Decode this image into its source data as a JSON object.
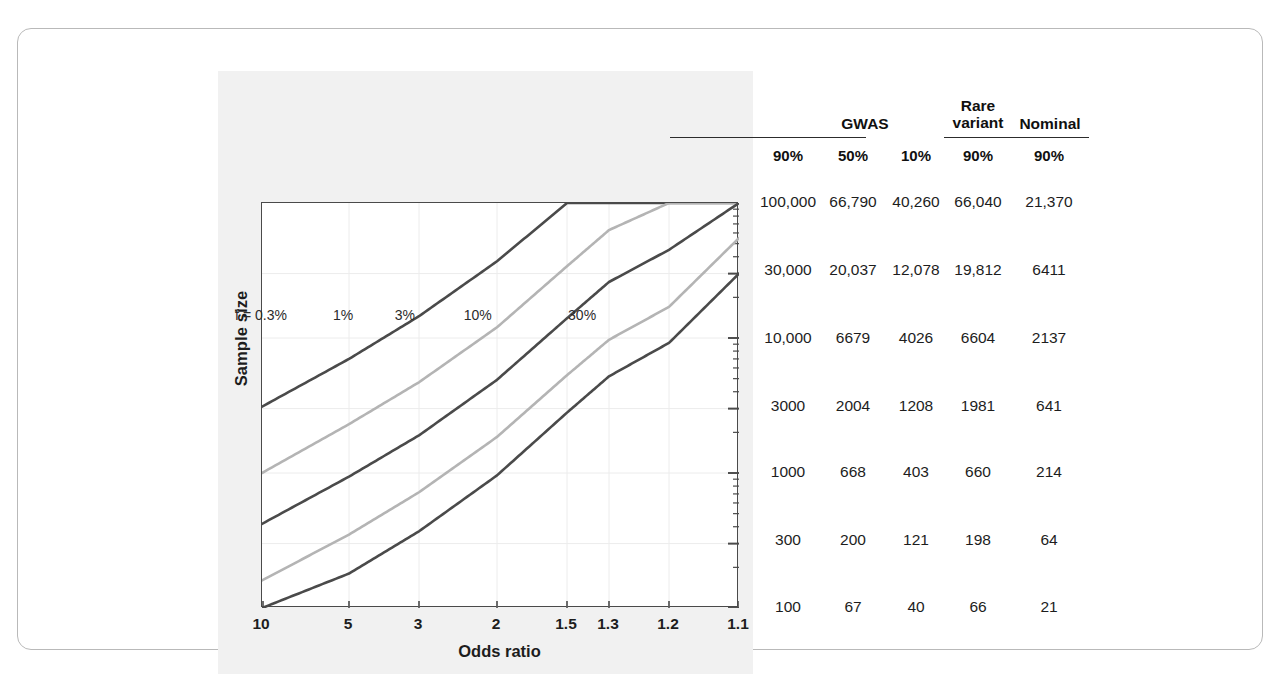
{
  "figure": {
    "y_axis_title": "Sample size",
    "x_axis_title": "Odds ratio"
  },
  "chart_data": {
    "type": "line",
    "title": "",
    "xlabel": "Odds ratio",
    "ylabel": "Sample size",
    "xscale": "log-reversed",
    "yscale": "log",
    "xlim": [
      10,
      1.1
    ],
    "ylim": [
      100,
      100000
    ],
    "grid": true,
    "legend_position": "inline-curve-labels",
    "x_ticks": [
      "10",
      "5",
      "3",
      "2",
      "1.5",
      "1.3",
      "1.2",
      "1.1"
    ],
    "x_tick_values": [
      10,
      5,
      3,
      2,
      1.5,
      1.3,
      1.2,
      1.1
    ],
    "y_ticks": [
      "100,000",
      "30,000",
      "10,000",
      "3000",
      "1000",
      "300",
      "100"
    ],
    "y_tick_values": [
      100000,
      30000,
      10000,
      3000,
      1000,
      300,
      100
    ],
    "series": [
      {
        "name": "f = 0.3%",
        "label": "f = 0.3%",
        "color": "#4a4a4a",
        "label_x": 10.0,
        "label_y": 14500,
        "points_x": [
          10,
          5,
          3,
          2,
          1.5,
          1.3,
          1.2,
          1.1
        ],
        "points_y": [
          3100,
          7000,
          14500,
          37000,
          100000,
          100000,
          100000,
          100000
        ]
      },
      {
        "name": "1%",
        "label": "1%",
        "color": "#b4b4b4",
        "label_x": 5.2,
        "label_y": 14500,
        "points_x": [
          10,
          5,
          3,
          2,
          1.5,
          1.3,
          1.2,
          1.1
        ],
        "points_y": [
          1000,
          2300,
          4700,
          12000,
          34000,
          63000,
          100000,
          100000
        ]
      },
      {
        "name": "3%",
        "label": "3%",
        "color": "#4a4a4a",
        "label_x": 3.3,
        "label_y": 14500,
        "points_x": [
          10,
          5,
          3,
          2,
          1.5,
          1.3,
          1.2,
          1.1
        ],
        "points_y": [
          420,
          940,
          1900,
          4900,
          14000,
          26000,
          45000,
          100000
        ]
      },
      {
        "name": "10%",
        "label": "10%",
        "color": "#b4b4b4",
        "label_x": 2.2,
        "label_y": 14500,
        "points_x": [
          10,
          5,
          3,
          2,
          1.5,
          1.3,
          1.2,
          1.1
        ],
        "points_y": [
          160,
          350,
          720,
          1850,
          5300,
          9700,
          17000,
          55000
        ]
      },
      {
        "name": "30%",
        "label": "30%",
        "color": "#4a4a4a",
        "label_x": 1.42,
        "label_y": 14500,
        "points_x": [
          10,
          5,
          3,
          2,
          1.5,
          1.3,
          1.2,
          1.1
        ],
        "points_y": [
          100,
          180,
          370,
          960,
          2800,
          5200,
          9200,
          30000
        ]
      }
    ]
  },
  "table": {
    "group_headers": [
      {
        "label": "GWAS",
        "center": 112,
        "rule_left": 15,
        "rule_width": 196
      },
      {
        "label": "Rare\nvariant",
        "line1": "Rare",
        "line2": "variant",
        "center": 225,
        "rule_left": 225,
        "rule_width": 68
      },
      {
        "label": "Nominal",
        "center": 297,
        "rule_left": 297,
        "rule_width": 78
      }
    ],
    "sub_headers": [
      "90%",
      "50%",
      "10%",
      "90%",
      "90%"
    ],
    "column_centers": [
      35,
      100,
      163,
      225,
      296
    ],
    "rows": [
      {
        "y": 123,
        "values": [
          "100,000",
          "66,790",
          "40,260",
          "66,040",
          "21,370"
        ]
      },
      {
        "y": 191,
        "values": [
          "30,000",
          "20,037",
          "12,078",
          "19,812",
          "6411"
        ]
      },
      {
        "y": 259,
        "values": [
          "10,000",
          "6679",
          "4026",
          "6604",
          "2137"
        ]
      },
      {
        "y": 327,
        "values": [
          "3000",
          "2004",
          "1208",
          "1981",
          "641"
        ]
      },
      {
        "y": 393,
        "values": [
          "1000",
          "668",
          "403",
          "660",
          "214"
        ]
      },
      {
        "y": 461,
        "values": [
          "300",
          "200",
          "121",
          "198",
          "64"
        ]
      },
      {
        "y": 528,
        "values": [
          "100",
          "67",
          "40",
          "66",
          "21"
        ]
      }
    ]
  },
  "colors": {
    "curve_dark": "#4a4a4a",
    "curve_light": "#b4b4b4",
    "axis": "#4a4a4a",
    "grid": "#ececec",
    "panel_bg": "#f1f1f1",
    "text": "#1d1d1d"
  }
}
